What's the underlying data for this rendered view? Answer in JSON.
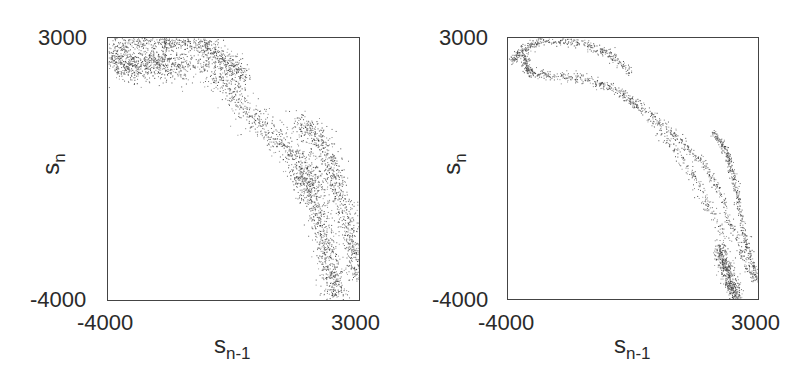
{
  "chart_data": [
    {
      "type": "scatter",
      "title": "",
      "xlabel": "s_{n-1}",
      "ylabel": "s_n",
      "xlim": [
        -4000,
        3000
      ],
      "ylim": [
        -4000,
        3000
      ],
      "x_ticks": [
        "-4000",
        "3000"
      ],
      "y_ticks": [
        "-4000",
        "3000"
      ],
      "grid": false,
      "legend": null,
      "description": "Diffuse return map: broad noisy band from upper-left cluster (~-3500, 2300) arcing down to lower-right (~3000, -3500)",
      "branches": [
        {
          "name": "upper-left cluster",
          "points": [
            [
              -3900,
              2600
            ],
            [
              -3500,
              2300
            ],
            [
              -3000,
              2300
            ],
            [
              -2400,
              2400
            ],
            [
              -1800,
              2200
            ]
          ],
          "spread": 330,
          "density": 1.0
        },
        {
          "name": "top arc",
          "points": [
            [
              -3800,
              2900
            ],
            [
              -2600,
              2950
            ],
            [
              -1500,
              2900
            ],
            [
              -800,
              2500
            ],
            [
              -200,
              1900
            ]
          ],
          "spread": 200,
          "density": 0.9
        },
        {
          "name": "main descending band",
          "points": [
            [
              -1500,
              2500
            ],
            [
              -700,
              1700
            ],
            [
              0,
              900
            ],
            [
              700,
              300
            ],
            [
              1400,
              -300
            ],
            [
              2000,
              -1000
            ]
          ],
          "spread": 260,
          "density": 0.85
        },
        {
          "name": "outer right band",
          "points": [
            [
              1300,
              800
            ],
            [
              1900,
              300
            ],
            [
              2300,
              -600
            ],
            [
              2600,
              -1700
            ],
            [
              2850,
              -2700
            ],
            [
              3000,
              -3400
            ]
          ],
          "spread": 240,
          "density": 1.0
        },
        {
          "name": "inner right band",
          "points": [
            [
              1300,
              -500
            ],
            [
              1700,
              -1300
            ],
            [
              2000,
              -2300
            ],
            [
              2200,
              -3200
            ],
            [
              2400,
              -4000
            ]
          ],
          "spread": 230,
          "density": 0.95
        }
      ]
    },
    {
      "type": "scatter",
      "title": "",
      "xlabel": "s_{n-1}",
      "ylabel": "s_n",
      "xlim": [
        -4000,
        3000
      ],
      "ylim": [
        -4000,
        3000
      ],
      "x_ticks": [
        "-4000",
        "3000"
      ],
      "y_ticks": [
        "-4000",
        "3000"
      ],
      "grid": false,
      "legend": null,
      "description": "Thin folded attractor: hook at upper-left, upper and lower arcs, splitting into several thin strands descending to lower-right",
      "branches": [
        {
          "name": "hook upper arc",
          "points": [
            [
              -3900,
              2400
            ],
            [
              -3600,
              2700
            ],
            [
              -3000,
              2950
            ],
            [
              -2000,
              2900
            ],
            [
              -1200,
              2600
            ],
            [
              -600,
              2100
            ]
          ],
          "spread": 90,
          "density": 1.0
        },
        {
          "name": "hook lower arc",
          "points": [
            [
              -3600,
              2500
            ],
            [
              -3400,
              2100
            ],
            [
              -2800,
              2000
            ],
            [
              -1800,
              1900
            ],
            [
              -900,
              1600
            ],
            [
              -300,
              1100
            ]
          ],
          "spread": 100,
          "density": 1.0
        },
        {
          "name": "middle strand",
          "points": [
            [
              -400,
              1300
            ],
            [
              200,
              600
            ],
            [
              800,
              -100
            ],
            [
              1300,
              -900
            ],
            [
              1800,
              -1800
            ],
            [
              2200,
              -3000
            ],
            [
              2400,
              -3900
            ]
          ],
          "spread": 120,
          "density": 0.75
        },
        {
          "name": "right strand A",
          "points": [
            [
              0,
              1000
            ],
            [
              800,
              300
            ],
            [
              1500,
              -400
            ],
            [
              2000,
              -1300
            ],
            [
              2400,
              -2400
            ],
            [
              2900,
              -3600
            ]
          ],
          "spread": 80,
          "density": 0.8
        },
        {
          "name": "right strand B",
          "points": [
            [
              1700,
              500
            ],
            [
              2100,
              0
            ],
            [
              2300,
              -700
            ],
            [
              2500,
              -1700
            ],
            [
              2700,
              -2700
            ],
            [
              3000,
              -3500
            ]
          ],
          "spread": 70,
          "density": 1.0
        },
        {
          "name": "lower-right cluster",
          "points": [
            [
              1900,
              -2600
            ],
            [
              2050,
              -3100
            ],
            [
              2200,
              -3600
            ],
            [
              2400,
              -3950
            ]
          ],
          "spread": 130,
          "density": 1.0
        }
      ]
    }
  ],
  "panels": [
    {
      "y_tick_top": "3000",
      "y_tick_bottom": "-4000",
      "x_tick_left": "-4000",
      "x_tick_right": "3000",
      "ylabel_main": "s",
      "ylabel_sub": "n",
      "xlabel_main": "s",
      "xlabel_sub": "n-1"
    },
    {
      "y_tick_top": "3000",
      "y_tick_bottom": "-4000",
      "x_tick_left": "-4000",
      "x_tick_right": "3000",
      "ylabel_main": "s",
      "ylabel_sub": "n",
      "xlabel_main": "s",
      "xlabel_sub": "n-1"
    }
  ],
  "colors": {
    "points": "#333333",
    "axes": "#444444",
    "text": "#2a2a2a"
  }
}
